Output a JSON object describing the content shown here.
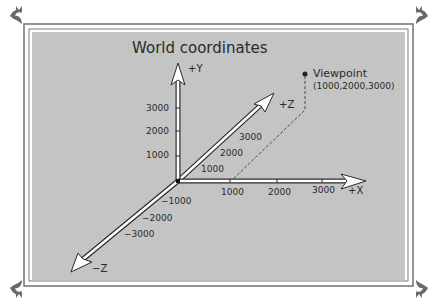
{
  "title": "World coordinates",
  "colors": {
    "panel": "#c4c4c4",
    "frame_line": "#7a7a7a",
    "axis_fill": "#ffffff",
    "axis_outline": "#2a2a2a",
    "text": "#2a2a2a"
  },
  "axes": {
    "y_positive": {
      "label": "+Y",
      "ticks": [
        "3000",
        "2000",
        "1000"
      ]
    },
    "x_positive": {
      "label": "+X",
      "ticks": [
        "1000",
        "2000",
        "3000"
      ]
    },
    "z_positive": {
      "label": "+Z",
      "ticks": [
        "1000",
        "2000",
        "3000"
      ]
    },
    "z_negative": {
      "label": "−Z",
      "ticks": [
        "−1000",
        "−2000",
        "−3000"
      ]
    }
  },
  "viewpoint": {
    "label": "Viewpoint",
    "coords": "(1000,2000,3000)",
    "x": 1000,
    "y": 2000,
    "z": 3000
  }
}
